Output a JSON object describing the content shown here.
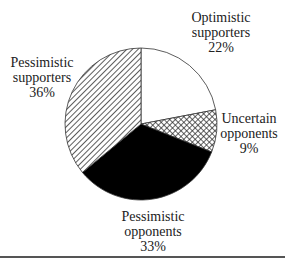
{
  "chart_data": {
    "type": "pie",
    "title": "",
    "start_angle_deg": 0,
    "direction": "clockwise",
    "slices": [
      {
        "name": "Optimistic supporters",
        "label_lines": [
          "Optimistic",
          "supporters"
        ],
        "value": 22,
        "value_label": "22%",
        "fill": "white"
      },
      {
        "name": "Uncertain opponents",
        "label_lines": [
          "Uncertain",
          "opponents"
        ],
        "value": 9,
        "value_label": "9%",
        "fill": "crosshatch"
      },
      {
        "name": "Pessimistic opponents",
        "label_lines": [
          "Pessimistic",
          "opponents"
        ],
        "value": 33,
        "value_label": "33%",
        "fill": "black"
      },
      {
        "name": "Pessimistic supporters",
        "label_lines": [
          "Pessimistic",
          "supporters"
        ],
        "value": 36,
        "value_label": "36%",
        "fill": "diagonal-hatch"
      }
    ],
    "categories": [
      "Optimistic supporters",
      "Uncertain opponents",
      "Pessimistic opponents",
      "Pessimistic supporters"
    ],
    "values": [
      22,
      9,
      33,
      36
    ],
    "legend": "none (direct labels)",
    "colors": {
      "outline": "#333333",
      "solid": "#000000",
      "hatch": "#333333",
      "background": "#ffffff"
    }
  }
}
